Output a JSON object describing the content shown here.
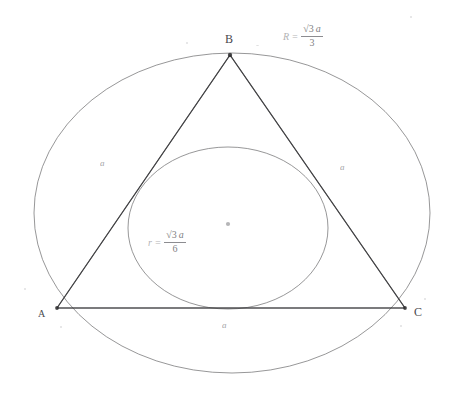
{
  "figure": {
    "background_color": "#ffffff",
    "stroke_color": "#6f6f70",
    "line_color": "#3d3d3f"
  },
  "vertices": [
    {
      "id": "A",
      "label": "A",
      "x": 57,
      "y": 308
    },
    {
      "id": "B",
      "label": "B",
      "x": 230,
      "y": 55
    },
    {
      "id": "C",
      "label": "C",
      "x": 405,
      "y": 308
    }
  ],
  "center": {
    "label": "O",
    "x": 228,
    "y": 224
  },
  "side_labels": [
    {
      "id": "side-ab",
      "label": "a",
      "x": 100,
      "y": 158
    },
    {
      "id": "side-bc",
      "label": "a",
      "x": 340,
      "y": 162
    },
    {
      "id": "side-ca",
      "label": "a",
      "x": 222,
      "y": 320
    }
  ],
  "formulas": {
    "circumradius": {
      "lead": "R =",
      "radical": "√3",
      "numerator_var": "a",
      "denominator": "3",
      "x": 283,
      "y": 24
    },
    "inradius": {
      "lead": "r =",
      "radical": "√3",
      "numerator_var": "a",
      "denominator": "6",
      "x": 148,
      "y": 230
    }
  },
  "circumcircle": {
    "label": "circumcircle",
    "cx": 232,
    "cy": 213,
    "rx": 198,
    "ry": 160
  },
  "incircle": {
    "label": "incircle",
    "cx": 228,
    "cy": 228,
    "rx": 100,
    "ry": 81
  }
}
